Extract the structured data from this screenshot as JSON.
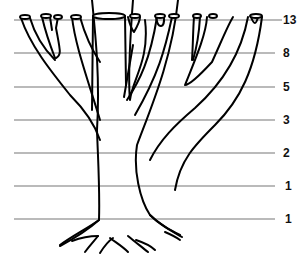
{
  "diagram": {
    "levels": [
      {
        "y": 20,
        "label": "13"
      },
      {
        "y": 53,
        "label": "8"
      },
      {
        "y": 87,
        "label": "5"
      },
      {
        "y": 120,
        "label": "3"
      },
      {
        "y": 153,
        "label": "2"
      },
      {
        "y": 186,
        "label": "1"
      },
      {
        "y": 219,
        "label": "1"
      }
    ],
    "line_color": "#777777",
    "ink_color": "#000000"
  }
}
